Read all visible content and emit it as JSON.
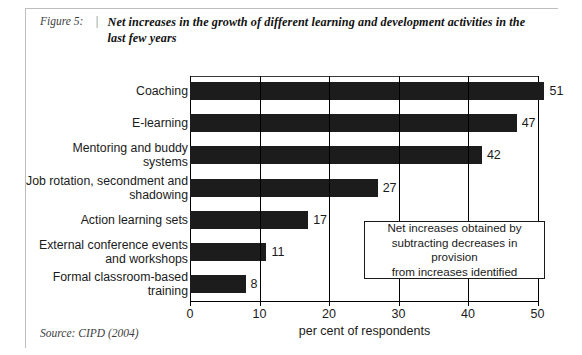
{
  "figure": {
    "label": "Figure 5:",
    "separator": "|",
    "title": "Net increases in the growth of different learning and development activities in the last few years",
    "source": "Source: CIPD (2004)"
  },
  "annotation": {
    "text": "Net increases obtained by\nsubtracting decreases in provision\nfrom increases identified"
  },
  "chart_data": {
    "type": "bar",
    "orientation": "horizontal",
    "title": "Net increases in the growth of different learning and development activities in the last few years",
    "xlabel": "per cent of respondents",
    "ylabel": "",
    "xlim": [
      0,
      50
    ],
    "xticks": [
      0,
      10,
      20,
      30,
      40,
      50
    ],
    "xtick_labels": [
      "0",
      "10",
      "20",
      "30",
      "40",
      "50"
    ],
    "grid": true,
    "legend": false,
    "bar_color": "#1c1c1c",
    "categories": [
      "Coaching",
      "E-learning",
      "Mentoring and buddy\nsystems",
      "Job rotation, secondment and\nshadowing",
      "Action learning sets",
      "External conference events\nand workshops",
      "Formal classroom-based\ntraining"
    ],
    "values": [
      51,
      47,
      42,
      27,
      17,
      11,
      8
    ],
    "data_labels": [
      "51",
      "47",
      "42",
      "27",
      "17",
      "11",
      "8"
    ],
    "annotations": [
      "Net increases obtained by subtracting decreases in provision from increases identified"
    ],
    "source": "CIPD (2004)"
  }
}
